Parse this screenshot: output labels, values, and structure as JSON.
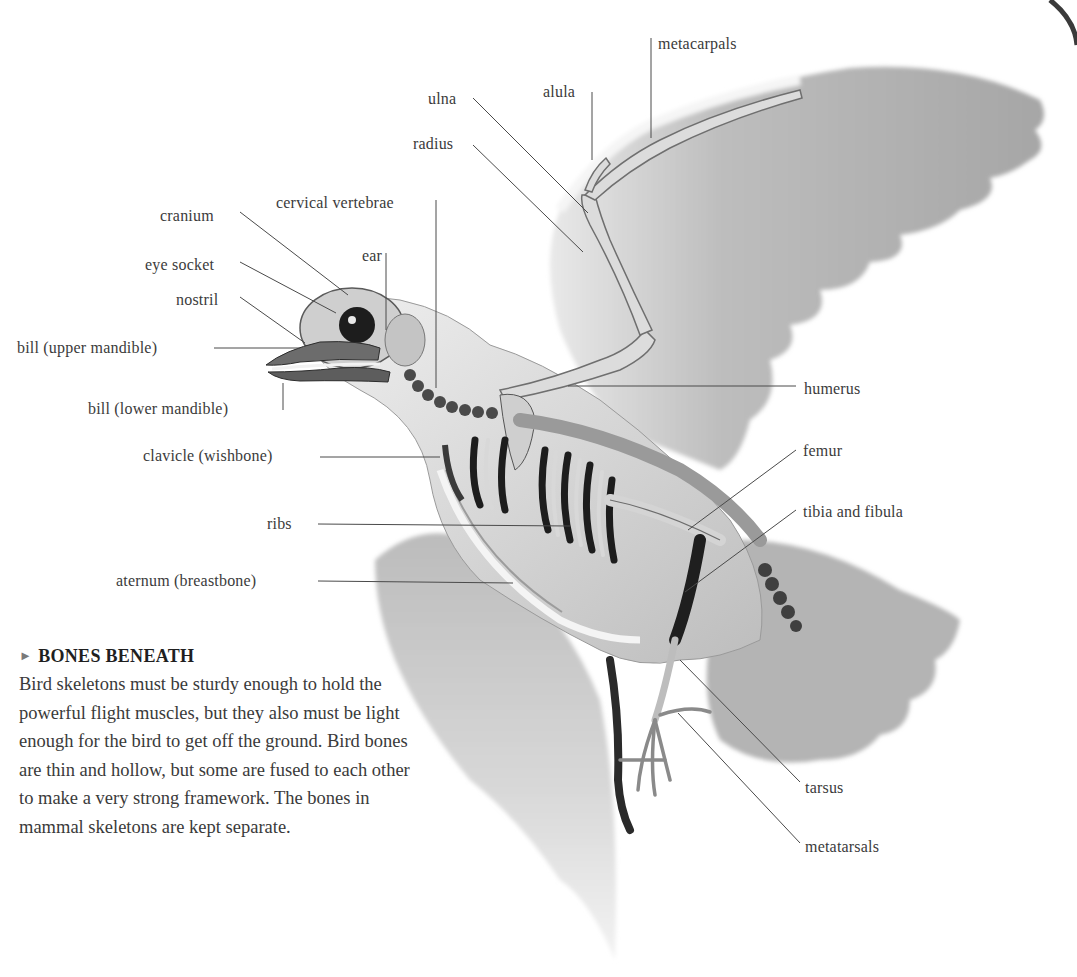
{
  "figure": {
    "labels": [
      {
        "id": "metacarpals",
        "text": "metacarpals",
        "x": 658,
        "y": 35,
        "align": "left"
      },
      {
        "id": "alula",
        "text": "alula",
        "x": 543,
        "y": 83,
        "align": "left"
      },
      {
        "id": "ulna",
        "text": "ulna",
        "x": 428,
        "y": 90,
        "align": "left"
      },
      {
        "id": "radius",
        "text": "radius",
        "x": 413,
        "y": 135,
        "align": "left"
      },
      {
        "id": "cervical-vertebrae",
        "text": "cervical vertebrae",
        "x": 276,
        "y": 194,
        "align": "left"
      },
      {
        "id": "cranium",
        "text": "cranium",
        "x": 160,
        "y": 207,
        "align": "left"
      },
      {
        "id": "ear",
        "text": "ear",
        "x": 362,
        "y": 247,
        "align": "left"
      },
      {
        "id": "eye-socket",
        "text": "eye socket",
        "x": 145,
        "y": 256,
        "align": "left"
      },
      {
        "id": "nostril",
        "text": "nostril",
        "x": 176,
        "y": 291,
        "align": "left"
      },
      {
        "id": "bill-upper",
        "text": "bill (upper mandible)",
        "x": 17,
        "y": 339,
        "align": "left"
      },
      {
        "id": "bill-lower",
        "text": "bill (lower mandible)",
        "x": 88,
        "y": 400,
        "align": "left"
      },
      {
        "id": "humerus",
        "text": "humerus",
        "x": 804,
        "y": 380,
        "align": "left"
      },
      {
        "id": "clavicle",
        "text": "clavicle (wishbone)",
        "x": 143,
        "y": 447,
        "align": "left"
      },
      {
        "id": "femur",
        "text": "femur",
        "x": 803,
        "y": 442,
        "align": "left"
      },
      {
        "id": "tibia-fibula",
        "text": "tibia and fibula",
        "x": 803,
        "y": 503,
        "align": "left"
      },
      {
        "id": "ribs",
        "text": "ribs",
        "x": 267,
        "y": 515,
        "align": "left"
      },
      {
        "id": "sternum",
        "text": "aternum (breastbone)",
        "x": 116,
        "y": 572,
        "align": "left"
      },
      {
        "id": "tarsus",
        "text": "tarsus",
        "x": 805,
        "y": 779,
        "align": "left"
      },
      {
        "id": "metatarsals",
        "text": "metatarsals",
        "x": 805,
        "y": 838,
        "align": "left"
      }
    ],
    "leader_lines": [
      {
        "id": "metacarpals",
        "points": [
          [
            651,
            38
          ],
          [
            651,
            138
          ]
        ]
      },
      {
        "id": "alula",
        "points": [
          [
            592,
            92
          ],
          [
            592,
            160
          ]
        ]
      },
      {
        "id": "ulna",
        "points": [
          [
            473,
            98
          ],
          [
            588,
            213
          ]
        ]
      },
      {
        "id": "radius",
        "points": [
          [
            473,
            145
          ],
          [
            583,
            252
          ]
        ]
      },
      {
        "id": "cervical-vertebrae",
        "points": [
          [
            436,
            200
          ],
          [
            436,
            388
          ]
        ]
      },
      {
        "id": "cranium",
        "points": [
          [
            240,
            212
          ],
          [
            348,
            295
          ]
        ]
      },
      {
        "id": "ear",
        "points": [
          [
            386,
            253
          ],
          [
            386,
            330
          ]
        ]
      },
      {
        "id": "eye-socket",
        "points": [
          [
            240,
            262
          ],
          [
            336,
            313
          ]
        ]
      },
      {
        "id": "nostril",
        "points": [
          [
            240,
            297
          ],
          [
            305,
            343
          ]
        ]
      },
      {
        "id": "bill-upper",
        "points": [
          [
            214,
            348
          ],
          [
            300,
            348
          ]
        ]
      },
      {
        "id": "bill-lower",
        "points": [
          [
            283,
            410
          ],
          [
            283,
            383
          ]
        ]
      },
      {
        "id": "humerus",
        "points": [
          [
            568,
            386
          ],
          [
            796,
            386
          ]
        ]
      },
      {
        "id": "clavicle",
        "points": [
          [
            320,
            457
          ],
          [
            440,
            457
          ]
        ]
      },
      {
        "id": "femur",
        "points": [
          [
            688,
            530
          ],
          [
            796,
            450
          ]
        ]
      },
      {
        "id": "tibia-fibula",
        "points": [
          [
            685,
            592
          ],
          [
            796,
            510
          ]
        ]
      },
      {
        "id": "ribs",
        "points": [
          [
            318,
            524
          ],
          [
            570,
            526
          ]
        ]
      },
      {
        "id": "sternum",
        "points": [
          [
            318,
            581
          ],
          [
            513,
            583
          ]
        ]
      },
      {
        "id": "tarsus",
        "points": [
          [
            680,
            660
          ],
          [
            800,
            782
          ]
        ]
      },
      {
        "id": "metatarsals",
        "points": [
          [
            678,
            713
          ],
          [
            800,
            843
          ]
        ]
      }
    ]
  },
  "caption": {
    "marker": "►",
    "title": "BONES BENEATH",
    "body": "Bird skeletons must be sturdy enough to hold the powerful flight muscles, but they also must be light enough for the bird to get off the ground. Bird bones are thin and hollow, but some are fused to each other to make a very strong framework. The bones in mammal skeletons are kept separate."
  },
  "colors": {
    "background": "#ffffff",
    "label_text": "#3b3b3b",
    "leader_line": "#4a4a4a",
    "feather_gray": "#a9a9a9",
    "bone": "#d9d6cf",
    "bone_shadow": "#1e1e1e"
  }
}
